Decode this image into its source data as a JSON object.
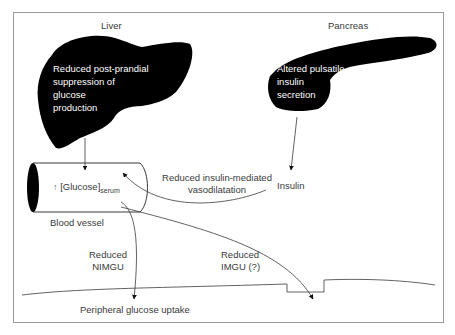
{
  "diagram": {
    "organs": {
      "liver": {
        "title": "Liver",
        "description_lines": [
          "Reduced post-prandial",
          "suppression of",
          "glucose",
          "production"
        ]
      },
      "pancreas": {
        "title": "Pancreas",
        "description_lines": [
          "Altered pulsatile",
          "insulin",
          "secretion"
        ]
      }
    },
    "vessel": {
      "arrow_symbol": "↑",
      "glucose_label": "[Glucose]",
      "glucose_subscript": "serum",
      "caption": "Blood vessel"
    },
    "insulin_label": "Insulin",
    "vasodilatation_lines": [
      "Reduced insulin-mediated",
      "vasodilatation"
    ],
    "nimgu_lines": [
      "Reduced",
      "NIMGU"
    ],
    "imgu_lines": [
      "Reduced",
      "IMGU (?)"
    ],
    "uptake_label": "Peripheral glucose uptake",
    "colors": {
      "organ_fill": "#000000",
      "line": "#3a3a3a",
      "frame": "#9a9a9a",
      "background": "#ffffff"
    }
  }
}
